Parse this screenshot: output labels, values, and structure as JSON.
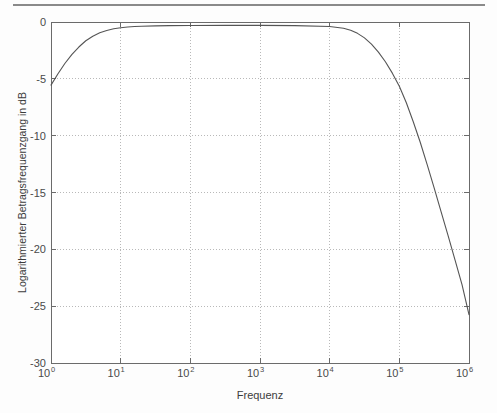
{
  "figure": {
    "header_rule": "horizontal-rule",
    "background_color": "#fdfdfd",
    "axis_color": "#6b6b6b",
    "grid_color": "#b9b9b9",
    "curve_color": "#555555"
  },
  "chart_data": {
    "type": "line",
    "title": "",
    "subtitle": "",
    "xlabel": "Frequenz",
    "ylabel": "Logarithmierter Betragsfrequenzgang in dB",
    "xscale": "log",
    "yscale": "linear",
    "xlim": [
      1,
      1000000
    ],
    "ylim": [
      -30,
      0
    ],
    "grid": true,
    "legend": null,
    "legend_position": "none",
    "x_ticks": [
      1,
      10,
      100,
      1000,
      10000,
      100000,
      1000000
    ],
    "x_tick_labels": [
      "10^0",
      "10^1",
      "10^2",
      "10^3",
      "10^4",
      "10^5",
      "10^6"
    ],
    "x_tick_mantissas": [
      "10",
      "10",
      "10",
      "10",
      "10",
      "10",
      "10"
    ],
    "x_tick_exponents": [
      "0",
      "1",
      "2",
      "3",
      "4",
      "5",
      "6"
    ],
    "y_ticks": [
      0,
      -5,
      -10,
      -15,
      -20,
      -25,
      -30
    ],
    "y_tick_labels": [
      "0",
      "-5",
      "-10",
      "-15",
      "-20",
      "-25",
      "-30"
    ],
    "series": [
      {
        "name": "Betragsfrequenzgang",
        "color": "#555555",
        "x": [
          1,
          1.26,
          1.58,
          2,
          2.51,
          3.16,
          3.98,
          5.01,
          6.31,
          7.94,
          10,
          12.6,
          15.8,
          20,
          31.6,
          50.1,
          100,
          316,
          1000,
          3160,
          10000,
          15800,
          20000,
          25100,
          31600,
          39800,
          50100,
          63100,
          79400,
          100000,
          126000,
          158000,
          200000,
          251000,
          316000,
          398000,
          501000,
          631000,
          794000,
          1000000
        ],
        "y": [
          -5.55,
          -4.55,
          -3.65,
          -2.85,
          -2.2,
          -1.65,
          -1.25,
          -0.95,
          -0.75,
          -0.6,
          -0.5,
          -0.44,
          -0.4,
          -0.38,
          -0.34,
          -0.32,
          -0.31,
          -0.3,
          -0.3,
          -0.32,
          -0.4,
          -0.55,
          -0.72,
          -1.0,
          -1.4,
          -1.95,
          -2.65,
          -3.5,
          -4.5,
          -5.65,
          -7.1,
          -8.75,
          -10.6,
          -12.55,
          -14.6,
          -16.7,
          -18.8,
          -20.95,
          -23.1,
          -25.75
        ]
      }
    ],
    "annotations": []
  }
}
